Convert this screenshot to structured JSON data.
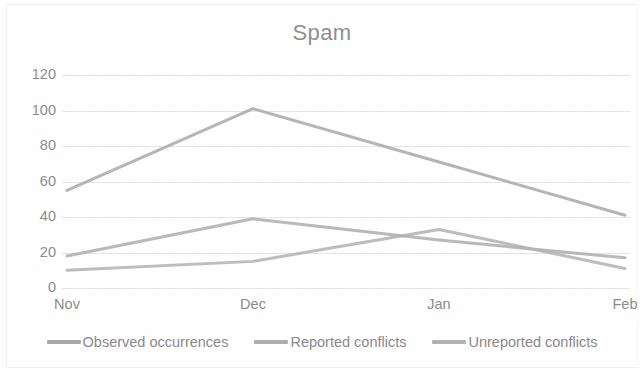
{
  "chart_data": {
    "type": "line",
    "title": "Spam",
    "xlabel": "",
    "ylabel": "",
    "categories": [
      "Nov",
      "Dec",
      "Jan",
      "Feb"
    ],
    "ylim": [
      0,
      120
    ],
    "yticks": [
      0,
      20,
      40,
      60,
      80,
      100,
      120
    ],
    "grid": true,
    "legend_position": "bottom",
    "series": [
      {
        "name": "Observed occurrences",
        "values": [
          55,
          101,
          71,
          41
        ],
        "color": "#a9a9a9"
      },
      {
        "name": "Reported conflicts",
        "values": [
          18,
          39,
          27,
          17
        ],
        "color": "#aeaeae"
      },
      {
        "name": "Unreported conflicts",
        "values": [
          10,
          15,
          33,
          11
        ],
        "color": "#b2b2b2"
      }
    ]
  },
  "axis": {
    "y_tick_labels": [
      "120",
      "100",
      "80",
      "60",
      "40",
      "20",
      "0"
    ],
    "x_tick_labels": [
      "Nov",
      "Dec",
      "Jan",
      "Feb"
    ]
  },
  "legend": {
    "items": [
      {
        "label": "Observed occurrences"
      },
      {
        "label": "Reported conflicts"
      },
      {
        "label": "Unreported conflicts"
      }
    ]
  },
  "colors": {
    "gridline": "#e4e4e4",
    "text": "#8c8c8c",
    "background": "#fefefe"
  }
}
